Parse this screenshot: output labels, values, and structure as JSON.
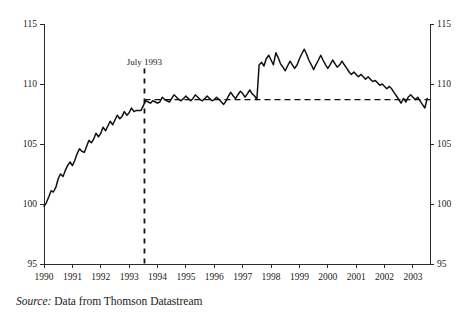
{
  "figure": {
    "source_prefix": "Source:",
    "source_text": " Data from Thomson Datastream"
  },
  "chart_data": {
    "type": "line",
    "title": "",
    "subtitle": "",
    "xlabel": "",
    "ylabel": "",
    "xlim": [
      1990.0,
      2003.6
    ],
    "ylim": [
      95,
      115
    ],
    "grid": false,
    "legend": "none",
    "y_axis_left": {
      "ticks": [
        95,
        100,
        105,
        110,
        115
      ],
      "tick_labels": [
        "95",
        "100",
        "105",
        "110",
        "115"
      ]
    },
    "y_axis_right": {
      "ticks": [
        95,
        100,
        105,
        110,
        115
      ],
      "tick_labels": [
        "95",
        "100",
        "105",
        "110",
        "115"
      ]
    },
    "x_axis": {
      "ticks": [
        1990,
        1991,
        1992,
        1993,
        1994,
        1995,
        1996,
        1997,
        1998,
        1999,
        2000,
        2001,
        2002,
        2003
      ],
      "tick_labels": [
        "1990",
        "1991",
        "1992",
        "1993",
        "1994",
        "1995",
        "1996",
        "1997",
        "1998",
        "1999",
        "2000",
        "2001",
        "2002",
        "2003"
      ]
    },
    "annotations": [
      {
        "name": "july-1993-marker",
        "label": "July 1993",
        "type": "vertical-dashed-line",
        "x": 1993.54,
        "label_y": 111.6
      },
      {
        "name": "reference-level-line",
        "label": "",
        "type": "horizontal-dashed-line",
        "y": 108.7,
        "x_start": 1993.54,
        "x_end": 2003.6
      }
    ],
    "series": [
      {
        "name": "index",
        "color": "#111111",
        "x": [
          1990.0,
          1990.08,
          1990.17,
          1990.25,
          1990.33,
          1990.42,
          1990.5,
          1990.58,
          1990.67,
          1990.75,
          1990.83,
          1990.92,
          1991.0,
          1991.08,
          1991.17,
          1991.25,
          1991.33,
          1991.42,
          1991.5,
          1991.58,
          1991.67,
          1991.75,
          1991.83,
          1991.92,
          1992.0,
          1992.08,
          1992.17,
          1992.25,
          1992.33,
          1992.42,
          1992.5,
          1992.58,
          1992.67,
          1992.75,
          1992.83,
          1992.92,
          1993.0,
          1993.08,
          1993.17,
          1993.25,
          1993.33,
          1993.42,
          1993.5,
          1993.58,
          1993.67,
          1993.75,
          1993.83,
          1993.92,
          1994.0,
          1994.08,
          1994.17,
          1994.25,
          1994.33,
          1994.42,
          1994.5,
          1994.58,
          1994.67,
          1994.75,
          1994.83,
          1994.92,
          1995.0,
          1995.08,
          1995.17,
          1995.25,
          1995.33,
          1995.42,
          1995.5,
          1995.58,
          1995.67,
          1995.75,
          1995.83,
          1995.92,
          1996.0,
          1996.08,
          1996.17,
          1996.25,
          1996.33,
          1996.42,
          1996.5,
          1996.58,
          1996.67,
          1996.75,
          1996.83,
          1996.92,
          1997.0,
          1997.08,
          1997.17,
          1997.25,
          1997.33,
          1997.42,
          1997.5,
          1997.58,
          1997.67,
          1997.75,
          1997.83,
          1997.92,
          1998.0,
          1998.08,
          1998.17,
          1998.25,
          1998.33,
          1998.42,
          1998.5,
          1998.58,
          1998.67,
          1998.75,
          1998.83,
          1998.92,
          1999.0,
          1999.08,
          1999.17,
          1999.25,
          1999.33,
          1999.42,
          1999.5,
          1999.58,
          1999.67,
          1999.75,
          1999.83,
          1999.92,
          2000.0,
          2000.08,
          2000.17,
          2000.25,
          2000.33,
          2000.42,
          2000.5,
          2000.58,
          2000.67,
          2000.75,
          2000.83,
          2000.92,
          2001.0,
          2001.08,
          2001.17,
          2001.25,
          2001.33,
          2001.42,
          2001.5,
          2001.58,
          2001.67,
          2001.75,
          2001.83,
          2001.92,
          2002.0,
          2002.08,
          2002.17,
          2002.25,
          2002.33,
          2002.42,
          2002.5,
          2002.58,
          2002.67,
          2002.75,
          2002.83,
          2002.92,
          2003.0,
          2003.08,
          2003.17,
          2003.25,
          2003.33,
          2003.42,
          2003.5
        ],
        "values": [
          99.8,
          100.1,
          100.6,
          101.1,
          101.0,
          101.4,
          102.1,
          102.5,
          102.3,
          102.8,
          103.2,
          103.5,
          103.2,
          103.6,
          104.2,
          104.6,
          104.4,
          104.3,
          104.8,
          105.3,
          105.1,
          105.4,
          105.9,
          105.6,
          105.9,
          106.4,
          106.1,
          106.5,
          106.9,
          106.6,
          107.0,
          107.4,
          107.1,
          107.3,
          107.7,
          107.4,
          107.6,
          108.0,
          107.7,
          107.8,
          107.8,
          107.8,
          108.2,
          108.6,
          108.5,
          108.4,
          108.6,
          108.5,
          108.4,
          108.5,
          108.9,
          108.7,
          108.6,
          108.5,
          108.8,
          109.1,
          108.9,
          108.7,
          108.6,
          108.8,
          109.0,
          108.8,
          108.6,
          108.8,
          109.1,
          108.9,
          108.7,
          108.6,
          108.8,
          109.0,
          108.8,
          108.6,
          108.7,
          108.9,
          108.7,
          108.5,
          108.3,
          108.6,
          109.0,
          109.3,
          109.0,
          108.8,
          109.1,
          109.4,
          109.2,
          108.9,
          109.2,
          109.5,
          109.2,
          109.0,
          108.7,
          111.6,
          111.8,
          111.5,
          112.1,
          112.4,
          112.0,
          111.6,
          112.6,
          112.2,
          111.7,
          111.4,
          111.1,
          111.5,
          111.9,
          111.6,
          111.3,
          111.6,
          112.1,
          112.5,
          112.9,
          112.5,
          112.0,
          111.6,
          111.2,
          111.6,
          112.0,
          112.4,
          112.0,
          111.6,
          111.3,
          111.6,
          112.0,
          111.7,
          111.4,
          111.6,
          111.9,
          111.6,
          111.3,
          111.0,
          110.8,
          111.0,
          110.8,
          110.6,
          110.8,
          110.6,
          110.4,
          110.6,
          110.4,
          110.2,
          110.3,
          110.1,
          109.9,
          110.0,
          109.8,
          109.6,
          109.8,
          109.6,
          109.3,
          109.0,
          108.7,
          108.4,
          108.8,
          108.5,
          108.9,
          109.1,
          108.9,
          108.7,
          108.9,
          108.6,
          108.3,
          108.0,
          108.8
        ]
      }
    ]
  }
}
